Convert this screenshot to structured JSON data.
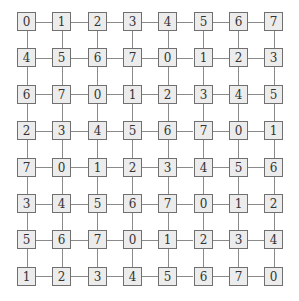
{
  "diagram": {
    "type": "grid-graph",
    "rows": 8,
    "cols": 8,
    "connections": "4-neighbor mesh (horizontal and vertical edges between adjacent nodes)",
    "node_fill": "#ececec",
    "node_border": "#707070",
    "edge_color": "#8a8a8a",
    "labels": [
      [
        "0",
        "1",
        "2",
        "3",
        "4",
        "5",
        "6",
        "7"
      ],
      [
        "4",
        "5",
        "6",
        "7",
        "0",
        "1",
        "2",
        "3"
      ],
      [
        "6",
        "7",
        "0",
        "1",
        "2",
        "3",
        "4",
        "5"
      ],
      [
        "2",
        "3",
        "4",
        "5",
        "6",
        "7",
        "0",
        "1"
      ],
      [
        "7",
        "0",
        "1",
        "2",
        "3",
        "4",
        "5",
        "6"
      ],
      [
        "3",
        "4",
        "5",
        "6",
        "7",
        "0",
        "1",
        "2"
      ],
      [
        "5",
        "6",
        "7",
        "0",
        "1",
        "2",
        "3",
        "4"
      ],
      [
        "1",
        "2",
        "3",
        "4",
        "5",
        "6",
        "7",
        "0"
      ]
    ]
  }
}
